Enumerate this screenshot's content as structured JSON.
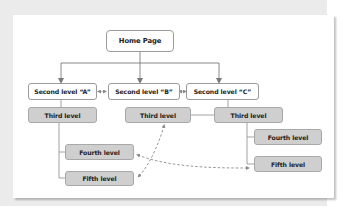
{
  "diagram": {
    "type": "site hierarchy",
    "colors": {
      "background": "#ebebeb",
      "card": "#ffffff",
      "node_light": "#ffffff",
      "node_dark": "#cfcfcf",
      "line": "#8a8a8a",
      "dashed": "#8a8a8a"
    },
    "nodes": {
      "home": "Home Page",
      "second_a": "Second level “A”",
      "second_b": "Second level “B”",
      "second_c": "Second level “C”",
      "third_a": "Third level",
      "third_b": "Third level",
      "third_c": "Third level",
      "fourth_a": "Fourth level",
      "fifth_a": "Fifth level",
      "fourth_c": "Fourth level",
      "fifth_c": "Fifth level"
    },
    "edges": [
      {
        "from": "home",
        "to": "second_a",
        "style": "solid-arrow"
      },
      {
        "from": "home",
        "to": "second_b",
        "style": "solid-arrow"
      },
      {
        "from": "home",
        "to": "second_c",
        "style": "solid-arrow"
      },
      {
        "from": "second_a",
        "to": "second_b",
        "style": "double-arrow"
      },
      {
        "from": "second_b",
        "to": "second_c",
        "style": "double-arrow"
      },
      {
        "from": "second_a",
        "to": "third_a",
        "style": "solid"
      },
      {
        "from": "third_a",
        "to": "fourth_a",
        "style": "solid"
      },
      {
        "from": "third_a",
        "to": "fifth_a",
        "style": "solid"
      },
      {
        "from": "second_c",
        "to": "third_b",
        "style": "solid"
      },
      {
        "from": "second_c",
        "to": "third_c",
        "style": "solid"
      },
      {
        "from": "third_c",
        "to": "fourth_c",
        "style": "solid"
      },
      {
        "from": "third_c",
        "to": "fifth_c",
        "style": "solid"
      },
      {
        "from": "fifth_a",
        "to": "third_b",
        "style": "dashed-double-arrow"
      },
      {
        "from": "fourth_a",
        "to": "fifth_c",
        "style": "dashed-double-arrow"
      }
    ]
  }
}
